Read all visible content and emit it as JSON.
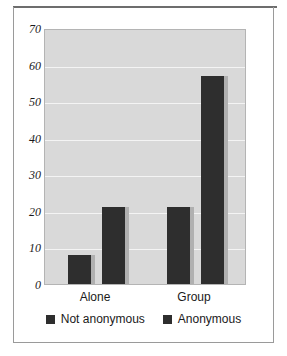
{
  "chart_data": {
    "type": "bar",
    "title": "",
    "subtitle": "",
    "xlabel": "",
    "ylabel": "",
    "categories": [
      "Alone",
      "Group"
    ],
    "series": [
      {
        "name": "Not anonymous",
        "values": [
          8,
          21
        ],
        "color": "#2e2e2e"
      },
      {
        "name": "Anonymous",
        "values": [
          21,
          57
        ],
        "color": "#2e2e2e"
      }
    ],
    "ylim": [
      0,
      70
    ],
    "yticks": [
      0,
      10,
      20,
      30,
      40,
      50,
      60,
      70
    ],
    "ytick_labels": [
      "0",
      "10",
      "20",
      "30",
      "40",
      "50",
      "60",
      "70"
    ],
    "grid": true,
    "grid_axis": "y",
    "legend_position": "bottom",
    "plot_background": "#d9d9d9",
    "gridline_color": "#f4f4f4",
    "frame_color": "#9a9a9a"
  },
  "yaxis": {
    "ticks": [
      {
        "label": "70",
        "value": 70
      },
      {
        "label": "60",
        "value": 60
      },
      {
        "label": "50",
        "value": 50
      },
      {
        "label": "40",
        "value": 40
      },
      {
        "label": "30",
        "value": 30
      },
      {
        "label": "20",
        "value": 20
      },
      {
        "label": "10",
        "value": 10
      },
      {
        "label": "0",
        "value": 0
      }
    ]
  },
  "xaxis": {
    "ticks": [
      {
        "label": "Alone"
      },
      {
        "label": "Group"
      }
    ]
  },
  "legend": {
    "entries": [
      {
        "label": "Not anonymous",
        "swatch": "legend-swatch-dark"
      },
      {
        "label": "Anonymous",
        "swatch": "legend-swatch-dark"
      }
    ]
  },
  "bars": [
    {
      "group": "Alone",
      "series": "Not anonymous",
      "value": 8
    },
    {
      "group": "Alone",
      "series": "Anonymous",
      "value": 21
    },
    {
      "group": "Group",
      "series": "Not anonymous",
      "value": 21
    },
    {
      "group": "Group",
      "series": "Anonymous",
      "value": 57
    }
  ]
}
